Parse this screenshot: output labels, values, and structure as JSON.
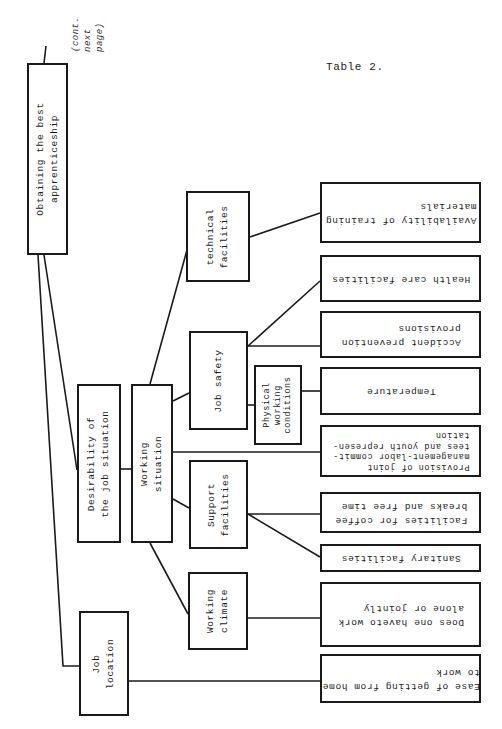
{
  "page": {
    "table_label": "Table 2.",
    "continuation_note": "(cont.\nnext\npage)"
  },
  "tree": {
    "root": "Obtaining the best\napprenticeship",
    "level1": {
      "desirability": "Desirability of\nthe job situation",
      "job_location": "Job\nlocation"
    },
    "level2": {
      "working_situation": "Working\nsituation"
    },
    "level3": {
      "technical_facilities": "technical\nfacilities",
      "job_safety": "Job safety",
      "physical_working_conditions": "Physical\nworking\nconditions",
      "support_facilities": "Support\nfacilities",
      "working_climate": "Working\nclimate"
    },
    "leaves": {
      "availability_training": "Availability of training\nmaterials",
      "health_care": "Health care facilities",
      "accident_prevention": "Accident prevention\nprovisions",
      "temperature": "Temperature",
      "provision_joint": "Provision of joint\nmanagement-labor commit-\ntees and youth represen-\ntation",
      "coffee_breaks": "Facilities for coffee\nbreaks and free time",
      "sanitary": "Sanitary facilities",
      "work_alone": "Does one haveto work\nalone or jointly",
      "ease_commute": "Ease of getting from home\nto work"
    }
  },
  "colors": {
    "ink": "#1a1a1a",
    "paper": "#ffffff"
  }
}
